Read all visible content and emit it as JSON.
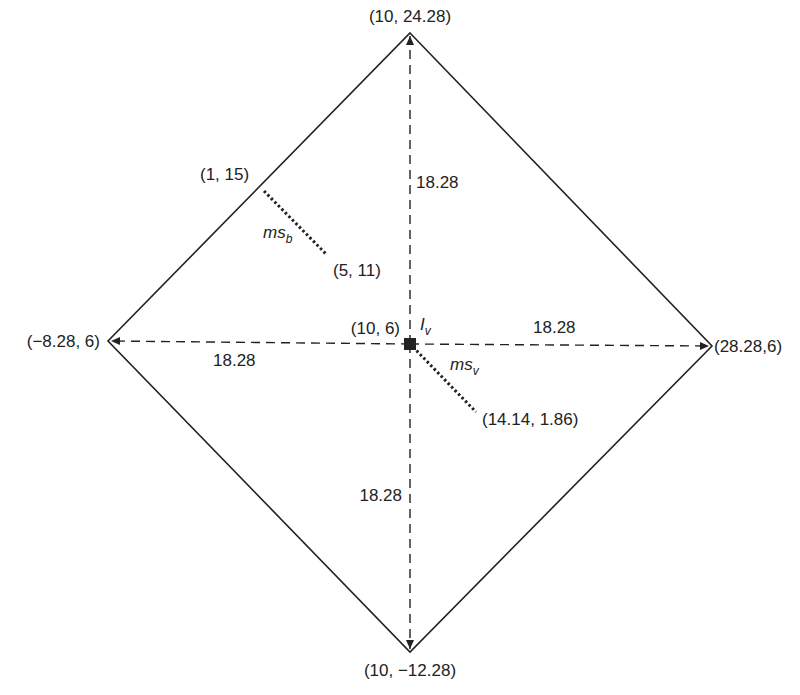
{
  "diagram": {
    "vertices": {
      "top": {
        "label": "(10, 24.28)"
      },
      "bottom": {
        "label": "(10, −12.28)"
      },
      "left": {
        "label": "(−8.28, 6)"
      },
      "right": {
        "label": "(28.28,6)"
      }
    },
    "center": {
      "label": "(10, 6)",
      "symbol": "I",
      "subscript": "v"
    },
    "distances": {
      "up": "18.28",
      "down": "18.28",
      "left": "18.28",
      "right": "18.28"
    },
    "ms_b": {
      "name": "ms",
      "subscript": "b",
      "start_label": "(1, 15)",
      "end_label": "(5, 11)"
    },
    "ms_v": {
      "name": "ms",
      "subscript": "v",
      "end_label": "(14.14, 1.86)"
    },
    "colors": {
      "line": "#222222",
      "background": "#ffffff"
    }
  }
}
